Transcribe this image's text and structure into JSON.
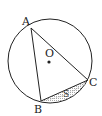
{
  "figure": {
    "points": {
      "A": "A",
      "B": "B",
      "C": "C",
      "O": "O"
    },
    "region_label": "S",
    "colors": {
      "stroke": "#222222",
      "shade": "#999999"
    }
  }
}
